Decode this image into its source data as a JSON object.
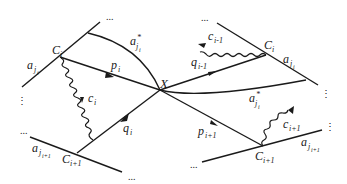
{
  "diagram": {
    "center_label": "X",
    "colors": {
      "ink": "#1a1a1a",
      "background": "#ffffff"
    },
    "left": {
      "top_line_label": {
        "base": "a",
        "sub": "j",
        "subsub": "i"
      },
      "curve_label": {
        "base": "a",
        "sup": "*",
        "sub": "j",
        "subsub": "i"
      },
      "vertex_top": {
        "base": "C",
        "sub": "i"
      },
      "vertex_bottom": {
        "base": "C",
        "sub": "i+1"
      },
      "edge_p": {
        "base": "p",
        "sub": "i"
      },
      "edge_q": {
        "base": "q",
        "sub": "i"
      },
      "wavy": {
        "base": "c",
        "sub": "i"
      },
      "bottom_line_label": {
        "base": "a",
        "sub": "j",
        "subsub": "i+1"
      }
    },
    "right": {
      "top_line_label": {
        "base": "a",
        "sub": "j",
        "subsub": "i"
      },
      "curve_label": {
        "base": "a",
        "sup": "*",
        "sub": "j",
        "subsub": "i"
      },
      "vertex_top": {
        "base": "C",
        "sub": "i"
      },
      "vertex_bottom": {
        "base": "C",
        "sub": "i+1"
      },
      "edge_q": {
        "base": "q",
        "sub": "i-1"
      },
      "edge_p": {
        "base": "p",
        "sub": "i+1"
      },
      "wavy_top": {
        "base": "c",
        "sub": "i-1"
      },
      "wavy_bottom": {
        "base": "c",
        "sub": "i+1"
      },
      "bottom_line_label": {
        "base": "a",
        "sub": "j",
        "subsub": "i+1"
      }
    },
    "ellipsis_h": "...",
    "ellipsis_v": "⋮"
  }
}
